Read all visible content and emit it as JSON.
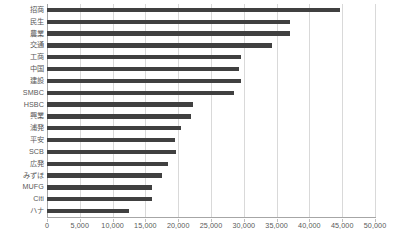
{
  "chart_data": {
    "type": "bar",
    "orientation": "horizontal",
    "title": "",
    "subtitle": "",
    "xlabel": "",
    "ylabel": "",
    "xlim": [
      0,
      50000
    ],
    "grid": true,
    "legend": false,
    "legend_position": "none",
    "xticks": [
      0,
      5000,
      10000,
      15000,
      20000,
      25000,
      30000,
      35000,
      40000,
      45000,
      50000
    ],
    "xtick_labels": [
      "0",
      "5,000",
      "10,000",
      "15,000",
      "20,000",
      "25,000",
      "30,000",
      "35,000",
      "40,000",
      "45,000",
      "50,000"
    ],
    "categories": [
      "招商",
      "民生",
      "農業",
      "交通",
      "工商",
      "中国",
      "建設",
      "SMBC",
      "HSBC",
      "興業",
      "浦発",
      "平安",
      "SCB",
      "広発",
      "みずほ",
      "MUFG",
      "Citi",
      "ハナ"
    ],
    "values": [
      44700,
      37000,
      37000,
      34300,
      29500,
      29300,
      29500,
      28500,
      22300,
      22000,
      20500,
      19500,
      19600,
      18500,
      17500,
      16000,
      16000,
      12500
    ],
    "bar_color": "#404040",
    "grid_color": "#d9d9d9",
    "axis_color": "#a6a6a6",
    "tick_text_color": "#595959"
  }
}
